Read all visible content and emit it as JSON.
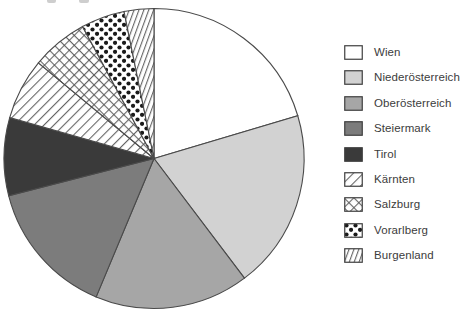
{
  "chart_data": {
    "type": "pie",
    "title": "",
    "legend_position": "right",
    "start_angle_deg": 0,
    "direction": "clockwise",
    "outline_color": "#4a4a4a",
    "slices": [
      {
        "label": "Wien",
        "value_pct": 20.4,
        "fill": "#ffffff",
        "pattern": "none"
      },
      {
        "label": "Niederösterreich",
        "value_pct": 19.3,
        "fill": "#d2d2d2",
        "pattern": "none"
      },
      {
        "label": "Oberösterreich",
        "value_pct": 16.6,
        "fill": "#a6a6a6",
        "pattern": "none"
      },
      {
        "label": "Steiermark",
        "value_pct": 14.7,
        "fill": "#7c7c7c",
        "pattern": "none"
      },
      {
        "label": "Tirol",
        "value_pct": 8.4,
        "fill": "#3a3a3a",
        "pattern": "none"
      },
      {
        "label": "Kärnten",
        "value_pct": 6.6,
        "fill": "#ffffff",
        "pattern": "diagonal-hatch"
      },
      {
        "label": "Salzburg",
        "value_pct": 6.1,
        "fill": "#ffffff",
        "pattern": "cross-hatch"
      },
      {
        "label": "Vorarlberg",
        "value_pct": 4.7,
        "fill": "#ffffff",
        "pattern": "dots"
      },
      {
        "label": "Burgenland",
        "value_pct": 3.2,
        "fill": "#ffffff",
        "pattern": "steep-hatch"
      }
    ]
  }
}
